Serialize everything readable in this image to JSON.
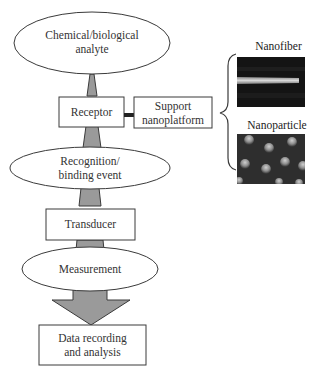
{
  "diagram": {
    "nodes": [
      {
        "id": "analyte",
        "shape": "ellipse",
        "lines": [
          "Chemical/biological",
          "analyte"
        ]
      },
      {
        "id": "receptor",
        "shape": "rect",
        "lines": [
          "Receptor"
        ]
      },
      {
        "id": "support",
        "shape": "rect",
        "lines": [
          "Support",
          "nanoplatform"
        ]
      },
      {
        "id": "recognition",
        "shape": "ellipse",
        "lines": [
          "Recognition/",
          "binding event"
        ]
      },
      {
        "id": "transducer",
        "shape": "rect",
        "lines": [
          "Transducer"
        ]
      },
      {
        "id": "measurement",
        "shape": "ellipse",
        "lines": [
          "Measurement"
        ]
      },
      {
        "id": "data",
        "shape": "rect",
        "lines": [
          "Data recording",
          "and analysis"
        ]
      }
    ],
    "edges": [
      {
        "from": "analyte",
        "to": "receptor",
        "style": "tapered-connector"
      },
      {
        "from": "receptor",
        "to": "support",
        "style": "thick-line"
      },
      {
        "from": "receptor",
        "to": "recognition",
        "style": "tapered-connector"
      },
      {
        "from": "recognition",
        "to": "transducer",
        "style": "tapered-connector"
      },
      {
        "from": "transducer",
        "to": "measurement",
        "style": "tapered-connector"
      },
      {
        "from": "measurement",
        "to": "data",
        "style": "block-arrow"
      }
    ],
    "bracket": {
      "from": "support",
      "groups": [
        "nanofiber",
        "nanoparticle"
      ]
    },
    "examples": {
      "nanofiber": {
        "label": "Nanofiber",
        "image": "nanofiber-micrograph"
      },
      "nanoparticle": {
        "label": "Nanoparticle",
        "image": "nanoparticle-micrograph"
      }
    },
    "colors": {
      "connector_fill": "#9a9a9a",
      "stroke": "#3a3a3a",
      "photo_bg": "#1a1a1a"
    }
  }
}
